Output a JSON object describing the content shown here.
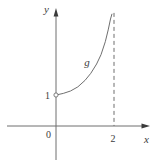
{
  "figure": {
    "background": "#ffffff",
    "line_color": "#6f6f6f",
    "text_color": "#3c3c3c"
  },
  "chart_data": {
    "type": "line",
    "title": "",
    "xlabel": "x",
    "ylabel": "y",
    "origin_label": "0",
    "grid": false,
    "legend": "none",
    "xlim": [
      -1.7,
      3.2
    ],
    "ylim": [
      -1.3,
      3.8
    ],
    "x_ticks": [
      {
        "value": 2,
        "label": "2"
      }
    ],
    "y_ticks": [
      {
        "value": 1,
        "label": "1"
      }
    ],
    "asymptote": {
      "x": 2,
      "style": "dashed",
      "from_y": 0,
      "to_y": 3.65
    },
    "series": [
      {
        "name": "g",
        "open_point": {
          "x": 0,
          "y": 1
        },
        "points": [
          [
            0,
            1
          ],
          [
            0.25,
            1.05
          ],
          [
            0.5,
            1.13
          ],
          [
            0.75,
            1.26
          ],
          [
            1.0,
            1.47
          ],
          [
            1.2,
            1.7
          ],
          [
            1.4,
            2.0
          ],
          [
            1.55,
            2.3
          ],
          [
            1.7,
            2.72
          ],
          [
            1.8,
            3.1
          ],
          [
            1.88,
            3.45
          ],
          [
            1.93,
            3.62
          ]
        ]
      }
    ]
  }
}
